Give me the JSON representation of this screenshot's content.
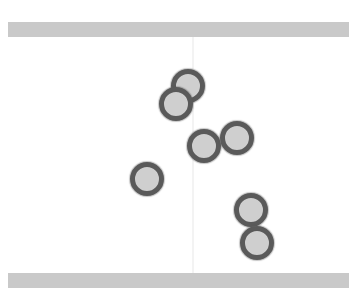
{
  "scene": {
    "background_color": "#ffffff",
    "walls": [
      {
        "id": "top-wall",
        "color": "#c9c9c9"
      },
      {
        "id": "bottom-wall",
        "color": "#c9c9c9"
      }
    ],
    "divider_color": "#f3f3f3",
    "balls": [
      {
        "id": 1,
        "cx": 188,
        "cy": 86
      },
      {
        "id": 2,
        "cx": 176,
        "cy": 104
      },
      {
        "id": 3,
        "cx": 204,
        "cy": 146
      },
      {
        "id": 4,
        "cx": 237,
        "cy": 138
      },
      {
        "id": 5,
        "cx": 147,
        "cy": 179
      },
      {
        "id": 6,
        "cx": 251,
        "cy": 210
      },
      {
        "id": 7,
        "cx": 257,
        "cy": 243
      }
    ],
    "ball_fill": "#cfcfcf",
    "ball_outline": "#5a5a5a",
    "ball_count": 7
  }
}
